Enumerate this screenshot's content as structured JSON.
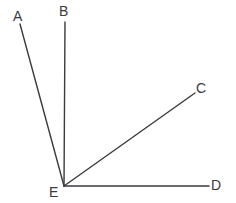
{
  "figure": {
    "kind": "angle-diagram",
    "background_color": "#ffffff",
    "line_color": "#3a3a3f",
    "label_color": "#3a3a3f",
    "canvas": {
      "width": 236,
      "height": 203
    },
    "vertex": {
      "id": "E",
      "label": "E",
      "x": 64,
      "y": 186
    },
    "rays": [
      {
        "id": "EA",
        "label": "A",
        "from_x": 64,
        "from_y": 186,
        "to_x": 20,
        "to_y": 24,
        "label_x": 13,
        "label_y": 9
      },
      {
        "id": "EB",
        "label": "B",
        "from_x": 64,
        "from_y": 186,
        "to_x": 65,
        "to_y": 22,
        "label_x": 59,
        "label_y": 4
      },
      {
        "id": "EC",
        "label": "C",
        "from_x": 64,
        "from_y": 186,
        "to_x": 195,
        "to_y": 93,
        "label_x": 196,
        "label_y": 81
      },
      {
        "id": "ED",
        "label": "D",
        "from_x": 64,
        "from_y": 186,
        "to_x": 209,
        "to_y": 186,
        "label_x": 211,
        "label_y": 178
      }
    ],
    "labels": {
      "A": "A",
      "B": "B",
      "C": "C",
      "D": "D",
      "E": "E"
    }
  }
}
